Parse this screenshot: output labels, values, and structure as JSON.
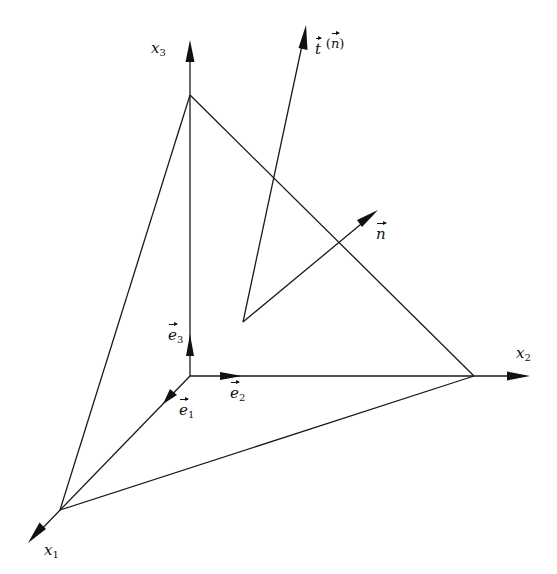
{
  "diagram": {
    "type": "Cauchy tetrahedron / traction vector on oblique plane",
    "colors": {
      "ink": "#111111",
      "background": "#ffffff"
    },
    "points": {
      "origin": [
        190,
        376
      ],
      "x3_vertex": [
        190,
        95
      ],
      "x3_tip": [
        190,
        40
      ],
      "x2_vertex": [
        474,
        376
      ],
      "x2_tip": [
        530,
        376
      ],
      "x1_vertex": [
        60,
        510
      ],
      "x1_tip": [
        28,
        543
      ],
      "vec_origin": [
        243,
        322
      ],
      "t_tip": [
        306,
        25
      ],
      "n_tip": [
        378,
        210
      ]
    },
    "axes": [
      {
        "name": "x1",
        "label_base": "x",
        "label_sub": "1"
      },
      {
        "name": "x2",
        "label_base": "x",
        "label_sub": "2"
      },
      {
        "name": "x3",
        "label_base": "x",
        "label_sub": "3"
      }
    ],
    "unit_vectors": [
      {
        "name": "e1",
        "label_base": "e",
        "label_sub": "1"
      },
      {
        "name": "e2",
        "label_base": "e",
        "label_sub": "2"
      },
      {
        "name": "e3",
        "label_base": "e",
        "label_sub": "3"
      }
    ],
    "vectors": {
      "traction": {
        "symbol": "t",
        "argument": "n",
        "open_paren": "(",
        "close_paren": ")"
      },
      "normal": {
        "symbol": "n"
      }
    }
  }
}
